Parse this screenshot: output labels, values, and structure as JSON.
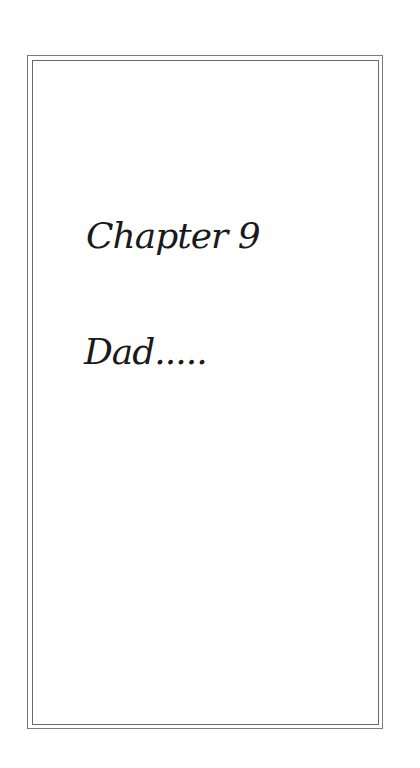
{
  "page": {
    "chapter_heading": "Chapter 9",
    "chapter_subtitle": "Dad....."
  },
  "colors": {
    "background": "#ffffff",
    "text": "#1a1a1a",
    "border": "#6a6a6a"
  }
}
